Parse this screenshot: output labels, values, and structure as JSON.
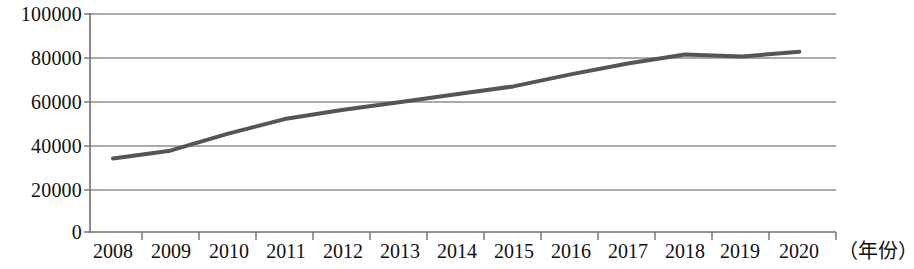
{
  "chart_data": {
    "type": "line",
    "title": "",
    "xlabel": "（年份）",
    "ylabel": "",
    "categories": [
      "2008",
      "2009",
      "2010",
      "2011",
      "2012",
      "2013",
      "2014",
      "2015",
      "2016",
      "2017",
      "2018",
      "2019",
      "2020"
    ],
    "values": [
      33700,
      37300,
      45000,
      51800,
      55900,
      59500,
      63200,
      66800,
      72300,
      77300,
      81400,
      80500,
      82700
    ],
    "series": [
      {
        "name": "",
        "values": [
          33700,
          37300,
          45000,
          51800,
          55900,
          59500,
          63200,
          66800,
          72300,
          77300,
          81400,
          80500,
          82700
        ]
      }
    ],
    "ylim": [
      0,
      100000
    ],
    "y_ticks": [
      0,
      20000,
      40000,
      60000,
      80000,
      100000
    ],
    "y_tick_labels": [
      "0",
      "20000",
      "40000",
      "60000",
      "80000",
      "100000"
    ],
    "x_tick_labels": [
      "2008",
      "2009",
      "2010",
      "2011",
      "2012",
      "2013",
      "2014",
      "2015",
      "2016",
      "2017",
      "2018",
      "2019",
      "2020"
    ],
    "grid": true,
    "grid_axis": "y",
    "legend": false,
    "legend_position": "none",
    "line_color": "#555555",
    "grid_color": "#8c8c8c",
    "axis_color": "#6e6e6e",
    "background_color": "#ffffff",
    "text_color": "#101010"
  }
}
